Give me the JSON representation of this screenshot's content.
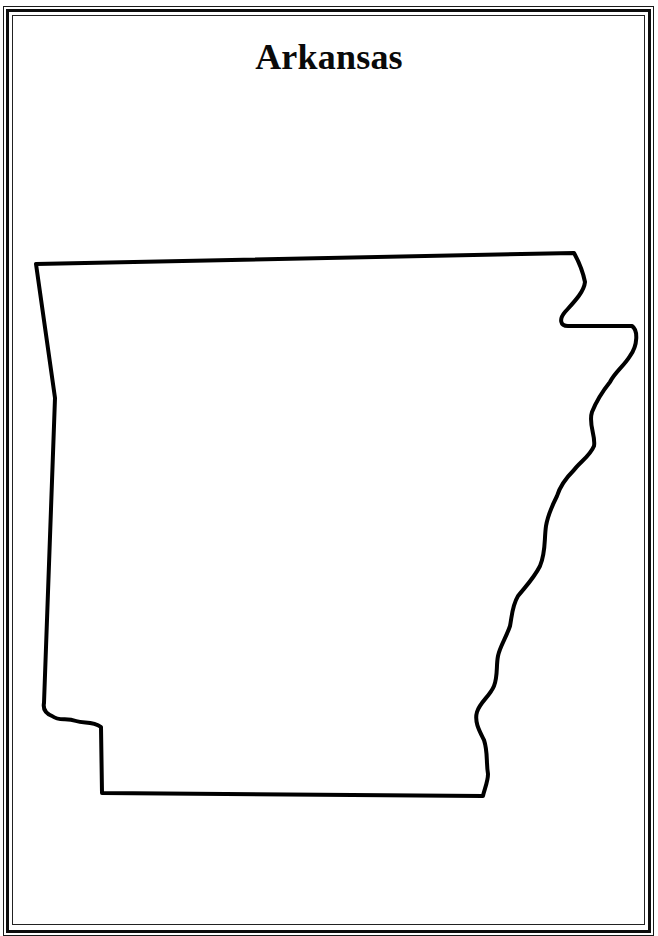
{
  "page": {
    "title": "Arkansas"
  },
  "map": {
    "state": "Arkansas",
    "outline_color": "#000000",
    "outline_width": 4,
    "background": "#ffffff"
  },
  "frame": {
    "style": "double-line-border",
    "color": "#111111"
  }
}
